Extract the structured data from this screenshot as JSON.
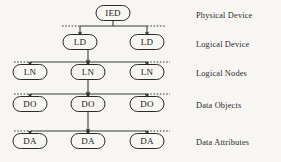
{
  "diagram": {
    "background_color": "#f7f6f3",
    "line_color": "#3b3b3b",
    "node_fill": "#f7f6f3",
    "node_stroke": "#2a2a2a",
    "rows": [
      {
        "id": "physical-device",
        "label": "Physical Device",
        "label_x": 196,
        "label_y": 11,
        "node_cy": 13,
        "bus_y": 26,
        "bus_x1": 80,
        "bus_x2": 147,
        "dash_left_x": 62,
        "dash_right_x": 166,
        "has_bus": false,
        "nodes": [
          {
            "id": "ied-1",
            "text": "IED",
            "cx": 113,
            "cy": 13,
            "w": 34,
            "h": 15
          }
        ]
      },
      {
        "id": "logical-device",
        "label": "Logical Device",
        "label_x": 196,
        "label_y": 40,
        "node_cy": 42,
        "bus_y": 26,
        "bus_x1": 80,
        "bus_x2": 147,
        "dash_left_x": 62,
        "dash_right_x": 166,
        "has_bus": true,
        "nodes": [
          {
            "id": "ld-1",
            "text": "LD",
            "cx": 80,
            "cy": 42,
            "w": 34,
            "h": 15
          },
          {
            "id": "ld-2",
            "text": "LD",
            "cx": 147,
            "cy": 42,
            "w": 34,
            "h": 15
          }
        ]
      },
      {
        "id": "logical-nodes",
        "label": "Logical Nodes",
        "label_x": 196,
        "label_y": 69,
        "node_cy": 72,
        "bus_y": 62,
        "bus_x1": 30,
        "bus_x2": 147,
        "dash_left_x": 14,
        "dash_right_x": 170,
        "has_bus": true,
        "nodes": [
          {
            "id": "ln-1",
            "text": "LN",
            "cx": 30,
            "cy": 72,
            "w": 34,
            "h": 15
          },
          {
            "id": "ln-2",
            "text": "LN",
            "cx": 88,
            "cy": 72,
            "w": 34,
            "h": 15
          },
          {
            "id": "ln-3",
            "text": "LN",
            "cx": 147,
            "cy": 72,
            "w": 34,
            "h": 15
          }
        ]
      },
      {
        "id": "data-objects",
        "label": "Data Objects",
        "label_x": 196,
        "label_y": 101,
        "node_cy": 104,
        "bus_y": 94,
        "bus_x1": 30,
        "bus_x2": 147,
        "dash_left_x": 14,
        "dash_right_x": 170,
        "has_bus": true,
        "nodes": [
          {
            "id": "do-1",
            "text": "DO",
            "cx": 30,
            "cy": 104,
            "w": 34,
            "h": 15
          },
          {
            "id": "do-2",
            "text": "DO",
            "cx": 88,
            "cy": 104,
            "w": 34,
            "h": 15
          },
          {
            "id": "do-3",
            "text": "DO",
            "cx": 147,
            "cy": 104,
            "w": 34,
            "h": 15
          }
        ]
      },
      {
        "id": "data-attributes",
        "label": "Data Attributes",
        "label_x": 196,
        "label_y": 138,
        "node_cy": 141,
        "bus_y": 131,
        "bus_x1": 30,
        "bus_x2": 147,
        "dash_left_x": 14,
        "dash_right_x": 170,
        "has_bus": true,
        "nodes": [
          {
            "id": "da-1",
            "text": "DA",
            "cx": 30,
            "cy": 141,
            "w": 34,
            "h": 15
          },
          {
            "id": "da-2",
            "text": "DA",
            "cx": 88,
            "cy": 141,
            "w": 34,
            "h": 15
          },
          {
            "id": "da-3",
            "text": "DA",
            "cx": 147,
            "cy": 141,
            "w": 34,
            "h": 15
          }
        ]
      }
    ],
    "connectors": [
      {
        "id": "ied-to-bus",
        "x": 113,
        "y1": 21,
        "y2": 26,
        "arrow": false
      },
      {
        "id": "bus-to-ld-1",
        "x": 80,
        "y1": 26,
        "y2": 34,
        "arrow": true
      },
      {
        "id": "bus-to-ld-2",
        "x": 147,
        "y1": 26,
        "y2": 34,
        "arrow": true
      },
      {
        "id": "ld1-to-bus",
        "x": 88,
        "y1": 50,
        "y2": 62,
        "arrow": true
      },
      {
        "id": "bus-to-ln-1",
        "x": 30,
        "y1": 62,
        "y2": 64,
        "arrow": true
      },
      {
        "id": "bus-to-ln-2",
        "x": 88,
        "y1": 62,
        "y2": 64,
        "arrow": true
      },
      {
        "id": "bus-to-ln-3",
        "x": 147,
        "y1": 62,
        "y2": 64,
        "arrow": true
      },
      {
        "id": "ln2-to-bus",
        "x": 88,
        "y1": 80,
        "y2": 94,
        "arrow": true
      },
      {
        "id": "bus-to-do-1",
        "x": 30,
        "y1": 94,
        "y2": 96,
        "arrow": true
      },
      {
        "id": "bus-to-do-2",
        "x": 88,
        "y1": 94,
        "y2": 96,
        "arrow": true
      },
      {
        "id": "bus-to-do-3",
        "x": 147,
        "y1": 94,
        "y2": 96,
        "arrow": true
      },
      {
        "id": "do2-to-bus",
        "x": 88,
        "y1": 112,
        "y2": 131,
        "arrow": true
      },
      {
        "id": "bus-to-da-1",
        "x": 30,
        "y1": 131,
        "y2": 133,
        "arrow": true
      },
      {
        "id": "bus-to-da-2",
        "x": 88,
        "y1": 131,
        "y2": 133,
        "arrow": true
      },
      {
        "id": "bus-to-da-3",
        "x": 147,
        "y1": 131,
        "y2": 133,
        "arrow": true
      }
    ]
  }
}
